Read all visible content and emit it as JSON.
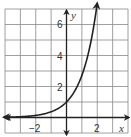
{
  "chart_data": {
    "type": "line",
    "title": "",
    "xlabel": "x",
    "ylabel": "y",
    "xlim": [
      -4,
      4
    ],
    "ylim": [
      -1,
      7
    ],
    "grid": true,
    "x_ticks_labeled": [
      -2,
      2
    ],
    "y_ticks_labeled": [
      2,
      4,
      6
    ],
    "tick_labels": {
      "x": [
        "−2",
        "2"
      ],
      "y": [
        "2",
        "4",
        "6"
      ]
    },
    "series": [
      {
        "name": "y = e^x",
        "function": "e^x",
        "x": [
          -4,
          -3,
          -2,
          -1,
          0,
          0.5,
          1,
          1.5,
          2
        ],
        "y": [
          0.02,
          0.05,
          0.14,
          0.37,
          1,
          1.65,
          2.72,
          4.48,
          7.39
        ],
        "arrow_left": true,
        "arrow_right": true
      }
    ],
    "colors": {
      "grid": "#888888",
      "axes": "#222222",
      "curve": "#222222"
    }
  }
}
